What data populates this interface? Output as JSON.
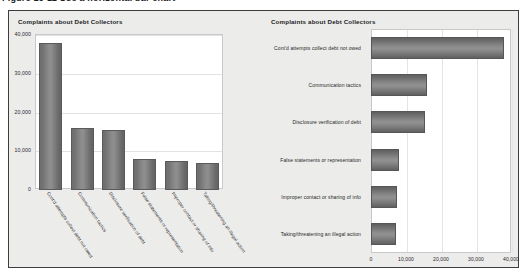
{
  "top_strip": {
    "cut_text": "Figure 16-11    Use a horizontal bar chart"
  },
  "panel": {
    "background_color": "#ececeb",
    "border_color": "#3d3d3d"
  },
  "chart_data": [
    {
      "type": "bar",
      "orientation": "vertical",
      "title": "Complaints about Debt Collectors",
      "categories": [
        "Cont'd attempts collect debt not owed",
        "Communication tactics",
        "Disclosure verification of debt",
        "False statements or representation",
        "Improper contact or sharing of info",
        "Taking/threatening an illegal action"
      ],
      "values": [
        38000,
        16000,
        15500,
        8000,
        7500,
        7000
      ],
      "xlabel": "",
      "ylabel": "",
      "ylim": [
        0,
        40000
      ],
      "yticks": [
        0,
        10000,
        20000,
        30000,
        40000
      ],
      "ytick_labels": [
        "0",
        "10,000",
        "20,000",
        "30,000",
        "40,000"
      ],
      "grid": true,
      "legend": false,
      "bar_color": "#808080"
    },
    {
      "type": "bar",
      "orientation": "horizontal",
      "title": "Complaints about Debt Collectors",
      "categories": [
        "Cont'd attempts collect debt not owed",
        "Communication tactics",
        "Disclosure verification of debt",
        "False statements or representation",
        "Improper contact or sharing of info",
        "Taking/threatening an illegal action"
      ],
      "values": [
        38000,
        16000,
        15500,
        8000,
        7500,
        7000
      ],
      "xlabel": "",
      "ylabel": "",
      "xlim": [
        0,
        40000
      ],
      "xticks": [
        0,
        10000,
        20000,
        30000,
        40000
      ],
      "xtick_labels": [
        "0",
        "10,000",
        "20,000",
        "30,000",
        "40,000"
      ],
      "grid": true,
      "legend": false,
      "bar_color": "#808080"
    }
  ]
}
